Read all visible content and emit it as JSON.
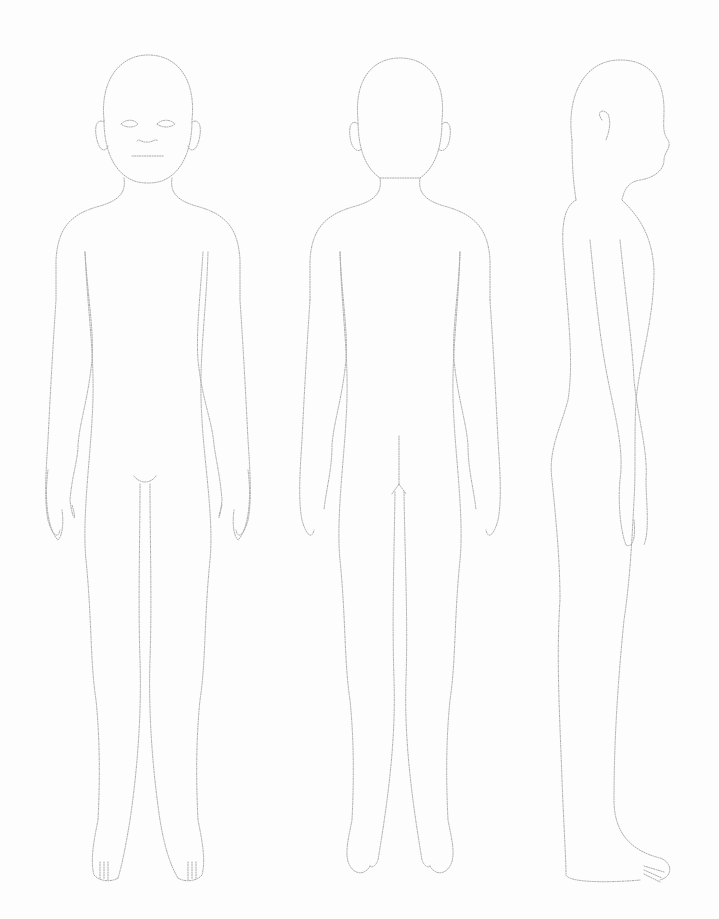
{
  "figure": {
    "title": "",
    "views": [
      {
        "id": "front",
        "label": ""
      },
      {
        "id": "back",
        "label": ""
      },
      {
        "id": "side",
        "label": ""
      }
    ],
    "line_color": "#a9a9a9",
    "background": "#fdfdfd",
    "style": "dotted outline"
  }
}
